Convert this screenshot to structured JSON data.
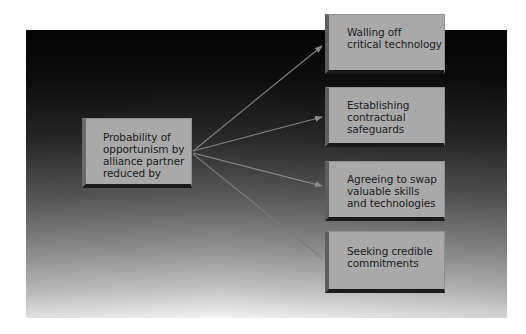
{
  "diagram": {
    "source": {
      "label": "Probability of\nopportunism by\nalliance partner\nreduced by"
    },
    "targets": [
      {
        "label": "Walling off\ncritical technology"
      },
      {
        "label": "Establishing\ncontractual\nsafeguards"
      },
      {
        "label": "Agreeing to swap\nvaluable skills\nand technologies"
      },
      {
        "label": "Seeking credible\ncommitments"
      }
    ],
    "edges": [
      {
        "from": "source",
        "to": 0
      },
      {
        "from": "source",
        "to": 1
      },
      {
        "from": "source",
        "to": 2
      },
      {
        "from": "source",
        "to": 3
      }
    ],
    "colors": {
      "background": "#ffffff",
      "panel_top": "#030303",
      "panel_bottom": "#f2f2f2",
      "box_fill": "#a9a9a9",
      "box_shadow": "#1a1a1a",
      "arrow": "#8a8a8a",
      "text": "#1c1c1c"
    }
  }
}
